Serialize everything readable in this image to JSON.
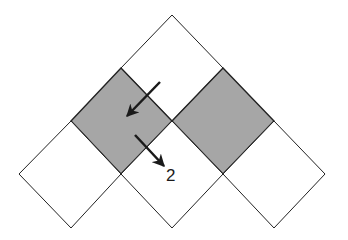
{
  "diagram": {
    "colors": {
      "background": "#ffffff",
      "stroke": "#222222",
      "shaded_fill": "#a6a6a6",
      "empty_fill": "#ffffff",
      "arrow": "#1a1a1a"
    },
    "cells": [
      {
        "id": "top",
        "shaded": false,
        "points": "172,15 223,68 172,121 121,68"
      },
      {
        "id": "middle-left",
        "shaded": true,
        "points": "121,68 172,121 121,174 71,121"
      },
      {
        "id": "middle-right",
        "shaded": true,
        "points": "223,68 274,121 223,174 172,121"
      },
      {
        "id": "bottom-left",
        "shaded": false,
        "points": "71,121 121,174 71,228 19,174"
      },
      {
        "id": "bottom-center",
        "shaded": false,
        "points": "172,121 223,174 172,228 121,174"
      },
      {
        "id": "bottom-right",
        "shaded": false,
        "points": "274,121 325,174 274,228 223,174"
      }
    ],
    "arrows": [
      {
        "id": "arrow-1",
        "x1": 160,
        "y1": 82,
        "x2": 127,
        "y2": 116
      },
      {
        "id": "arrow-2",
        "x1": 135,
        "y1": 135,
        "x2": 164,
        "y2": 166
      }
    ],
    "label": {
      "text": "2",
      "x": 166,
      "y": 181
    }
  }
}
